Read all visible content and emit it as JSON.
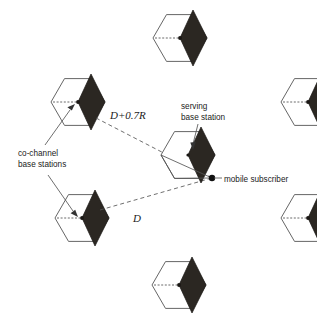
{
  "figure": {
    "background_color": "#ffffff",
    "cell_fill_color": "#ffffff",
    "cell_stroke_color": "#555555",
    "sector_fill_color": "#2b2722"
  },
  "labels": {
    "serving_base_station": {
      "line1": "serving",
      "line2": "base station"
    },
    "co_channel_base_stations": {
      "line1": "co-channel",
      "line2": "base stations"
    },
    "mobile_subscriber": "mobile subscriber",
    "distance_far": "D+0.7R",
    "distance_near": "D"
  },
  "cells": [
    {
      "name": "cell-top",
      "role": "co-channel",
      "cx": 180,
      "cy": 38,
      "r": 27
    },
    {
      "name": "cell-upper-left",
      "role": "co-channel",
      "cx": 78,
      "cy": 102,
      "r": 27
    },
    {
      "name": "cell-upper-right",
      "role": "co-channel",
      "cx": 308,
      "cy": 102,
      "r": 27
    },
    {
      "name": "cell-center",
      "role": "serving",
      "cx": 188,
      "cy": 155,
      "r": 27
    },
    {
      "name": "cell-lower-left",
      "role": "co-channel",
      "cx": 82,
      "cy": 218,
      "r": 27
    },
    {
      "name": "cell-lower-right",
      "role": "co-channel",
      "cx": 308,
      "cy": 218,
      "r": 27
    },
    {
      "name": "cell-bottom",
      "role": "co-channel",
      "cx": 179,
      "cy": 285,
      "r": 27
    }
  ],
  "mobile_subscriber": {
    "x": 212,
    "y": 178
  },
  "distance_lines": [
    {
      "name": "distance-line-far",
      "from": "cell-upper-left",
      "to": "mobile-subscriber",
      "label": "D+0.7R"
    },
    {
      "name": "distance-line-near",
      "from": "cell-lower-left",
      "to": "mobile-subscriber",
      "label": "D"
    }
  ]
}
